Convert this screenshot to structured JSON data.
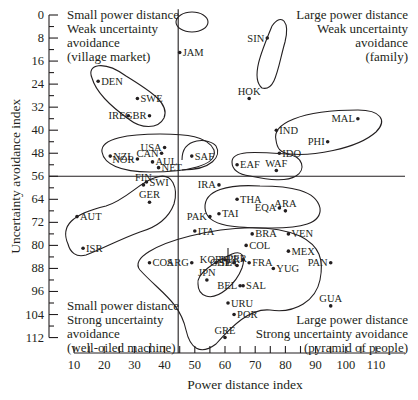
{
  "chart_data": {
    "type": "scatter",
    "title": "",
    "xlabel": "Power distance index",
    "ylabel": "Uncertainty avoidance index",
    "xlim": [
      10,
      120
    ],
    "ylim": [
      0,
      112
    ],
    "y_inverted": true,
    "grid": false,
    "x_ticks": [
      "10",
      "20",
      "30",
      "40",
      "50",
      "60",
      "70",
      "80",
      "90",
      "100",
      "110"
    ],
    "y_ticks": [
      "0",
      "8",
      "16",
      "24",
      "32",
      "40",
      "48",
      "56",
      "64",
      "72",
      "80",
      "88",
      "96",
      "104",
      "112"
    ],
    "dividers": {
      "x": 44.5,
      "y": 56
    },
    "quadrants": [
      {
        "pos": "top-left",
        "lines": [
          "Small power distance",
          "Weak uncertainty",
          "avoidance",
          "(village market)"
        ]
      },
      {
        "pos": "top-right",
        "lines": [
          "Large power distance",
          "Weak uncertainty",
          "avoidance",
          "(family)"
        ]
      },
      {
        "pos": "bottom-left",
        "lines": [
          "Small power distance",
          "Strong uncertainty",
          "avoidance",
          "(well-oiled machine)"
        ]
      },
      {
        "pos": "bottom-right",
        "lines": [
          "Large power distance",
          "Strong uncertainty avoidance",
          "(pyramid of people)"
        ]
      }
    ],
    "points": [
      {
        "label": "JAM",
        "x": 45,
        "y": 13
      },
      {
        "label": "SIN",
        "x": 74,
        "y": 8
      },
      {
        "label": "HOK",
        "x": 68,
        "y": 29
      },
      {
        "label": "DEN",
        "x": 18,
        "y": 23
      },
      {
        "label": "SWE",
        "x": 31,
        "y": 29
      },
      {
        "label": "IRE",
        "x": 28,
        "y": 35
      },
      {
        "label": "GBR",
        "x": 35,
        "y": 35
      },
      {
        "label": "IND",
        "x": 77,
        "y": 40
      },
      {
        "label": "MAL",
        "x": 104,
        "y": 36
      },
      {
        "label": "PHI",
        "x": 94,
        "y": 44
      },
      {
        "label": "IDO",
        "x": 78,
        "y": 48
      },
      {
        "label": "NZL",
        "x": 22,
        "y": 49
      },
      {
        "label": "NOR",
        "x": 31,
        "y": 50
      },
      {
        "label": "USA",
        "x": 40,
        "y": 46
      },
      {
        "label": "CAN",
        "x": 39,
        "y": 48
      },
      {
        "label": "NET",
        "x": 38,
        "y": 53
      },
      {
        "label": "AUL",
        "x": 36,
        "y": 51
      },
      {
        "label": "SAF",
        "x": 49,
        "y": 49
      },
      {
        "label": "EAF",
        "x": 64,
        "y": 52
      },
      {
        "label": "WAF",
        "x": 77,
        "y": 54
      },
      {
        "label": "SWI",
        "x": 34,
        "y": 58
      },
      {
        "label": "FIN",
        "x": 33,
        "y": 59
      },
      {
        "label": "GER",
        "x": 35,
        "y": 65
      },
      {
        "label": "AUT",
        "x": 11,
        "y": 70
      },
      {
        "label": "ISR",
        "x": 13,
        "y": 81
      },
      {
        "label": "IRA",
        "x": 58,
        "y": 59
      },
      {
        "label": "THA",
        "x": 64,
        "y": 64
      },
      {
        "label": "EQA",
        "x": 78,
        "y": 67
      },
      {
        "label": "PAK",
        "x": 55,
        "y": 70
      },
      {
        "label": "TAI",
        "x": 58,
        "y": 69
      },
      {
        "label": "ARA",
        "x": 80,
        "y": 68
      },
      {
        "label": "ITA",
        "x": 50,
        "y": 75
      },
      {
        "label": "BRA",
        "x": 69,
        "y": 76
      },
      {
        "label": "VEN",
        "x": 81,
        "y": 76
      },
      {
        "label": "CHL",
        "x": 63,
        "y": 86
      },
      {
        "label": "COL",
        "x": 67,
        "y": 80
      },
      {
        "label": "MEX",
        "x": 81,
        "y": 82
      },
      {
        "label": "KOR",
        "x": 60,
        "y": 85
      },
      {
        "label": "TUR",
        "x": 66,
        "y": 85
      },
      {
        "label": "ARG",
        "x": 49,
        "y": 86
      },
      {
        "label": "SPA",
        "x": 57,
        "y": 86
      },
      {
        "label": "COS",
        "x": 35,
        "y": 86
      },
      {
        "label": "FRA",
        "x": 68,
        "y": 86
      },
      {
        "label": "YUG",
        "x": 76,
        "y": 88
      },
      {
        "label": "PAN",
        "x": 95,
        "y": 86
      },
      {
        "label": "PER",
        "x": 64,
        "y": 87
      },
      {
        "label": "JPN",
        "x": 54,
        "y": 92
      },
      {
        "label": "BEL",
        "x": 65,
        "y": 94
      },
      {
        "label": "SAL",
        "x": 66,
        "y": 94
      },
      {
        "label": "URU",
        "x": 61,
        "y": 100
      },
      {
        "label": "POR",
        "x": 63,
        "y": 104
      },
      {
        "label": "GUA",
        "x": 95,
        "y": 101
      },
      {
        "label": "GRE",
        "x": 60,
        "y": 112
      }
    ]
  }
}
